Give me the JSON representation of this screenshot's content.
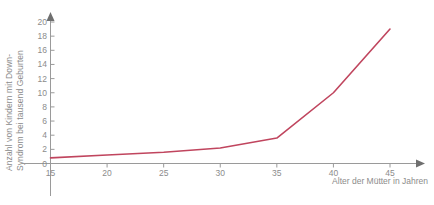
{
  "chart_data": {
    "type": "line",
    "title": "",
    "xlabel": "Alter der Mütter in Jahren",
    "ylabel_line1": "Anzahl von Kindern mit Down-",
    "ylabel_line2": "Syndrom bei tausend Geburten",
    "xlim": [
      15,
      47
    ],
    "ylim": [
      0,
      20.8
    ],
    "xticks": [
      15,
      20,
      25,
      30,
      35,
      40,
      45
    ],
    "yticks": [
      0,
      2,
      4,
      6,
      8,
      10,
      12,
      14,
      16,
      18,
      20
    ],
    "xtick_labels": [
      "15",
      "20",
      "25",
      "30",
      "35",
      "40",
      "45"
    ],
    "ytick_labels": [
      "0",
      "2",
      "4",
      "6",
      "8",
      "10",
      "12",
      "14",
      "16",
      "18",
      "20"
    ],
    "grid": false,
    "legend": "none",
    "series": [
      {
        "name": "Down-Syndrom Rate",
        "color": "#c0455e",
        "x": [
          15,
          20,
          25,
          30,
          35,
          40,
          45
        ],
        "values": [
          0.8,
          1.2,
          1.6,
          2.2,
          3.6,
          10.0,
          19.0
        ]
      }
    ]
  },
  "colors": {
    "line": "#c0455e",
    "axis": "#9a9a9a",
    "text": "#8c8c8c",
    "background": "#ffffff"
  }
}
